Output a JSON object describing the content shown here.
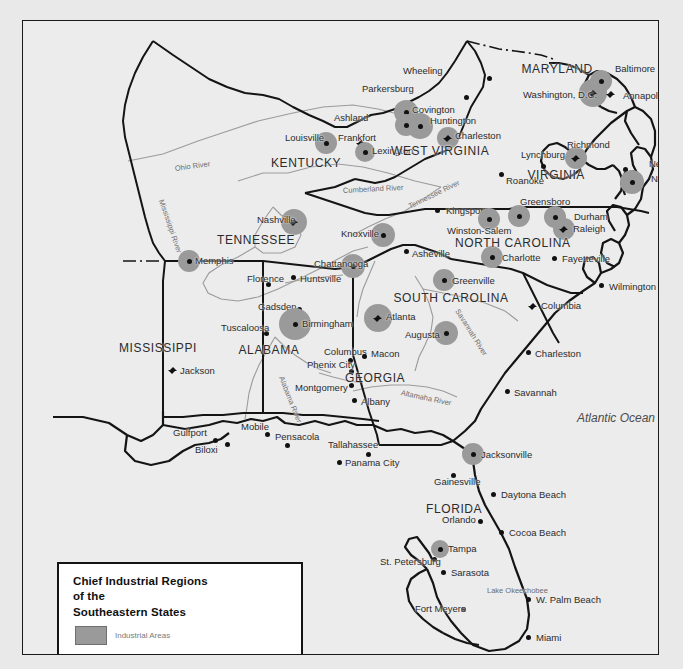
{
  "map": {
    "title_lines": [
      "Chief Industrial Regions",
      "of the",
      "Southeastern States"
    ],
    "legend_swatch_label": "Industrial Areas",
    "ocean_label": "Atlantic Ocean",
    "colors": {
      "background": "#ececec",
      "page": "#e9e9e9",
      "industrial_area": "#9a9a9a",
      "border": "#141414",
      "river": "#9b9b9b",
      "text": "#2b2b2b"
    },
    "states": [
      {
        "name": "MARYLAND",
        "x": 534,
        "y": 48
      },
      {
        "name": "WEST VIRGINIA",
        "x": 417,
        "y": 130
      },
      {
        "name": "KENTUCKY",
        "x": 283,
        "y": 142
      },
      {
        "name": "VIRGINIA",
        "x": 533,
        "y": 154
      },
      {
        "name": "TENNESSEE",
        "x": 233,
        "y": 219
      },
      {
        "name": "NORTH CAROLINA",
        "x": 490,
        "y": 222
      },
      {
        "name": "SOUTH CAROLINA",
        "x": 428,
        "y": 277
      },
      {
        "name": "MISSISSIPPI",
        "x": 135,
        "y": 327
      },
      {
        "name": "ALABAMA",
        "x": 246,
        "y": 329
      },
      {
        "name": "GEORGIA",
        "x": 352,
        "y": 357
      },
      {
        "name": "FLORIDA",
        "x": 431,
        "y": 488
      }
    ],
    "cities": [
      {
        "name": "Wheeling",
        "x": 420,
        "y": 50,
        "anchor": "right",
        "px": 466,
        "py": 57,
        "marker": "dot",
        "industrial": 0
      },
      {
        "name": "Parkersburg",
        "x": 391,
        "y": 68,
        "anchor": "right",
        "px": 443,
        "py": 76,
        "marker": "dot",
        "industrial": 0
      },
      {
        "name": "Covington",
        "x": 389,
        "y": 89,
        "anchor": "left",
        "px": 383,
        "py": 91,
        "marker": "dot",
        "industrial": 12
      },
      {
        "name": "Huntington",
        "x": 407,
        "y": 100,
        "anchor": "left",
        "px": 397,
        "py": 105,
        "marker": "dot",
        "industrial": 13
      },
      {
        "name": "Ashland",
        "x": 345,
        "y": 97,
        "anchor": "right",
        "px": 383,
        "py": 104,
        "marker": "dot",
        "industrial": 11
      },
      {
        "name": "Charleston",
        "x": 432,
        "y": 115,
        "anchor": "left",
        "px": 425,
        "py": 117,
        "marker": "cap",
        "industrial": 11
      },
      {
        "name": "Louisville",
        "x": 262,
        "y": 117,
        "anchor": "left",
        "px": 303,
        "py": 122,
        "marker": "dot",
        "industrial": 11
      },
      {
        "name": "Frankfort",
        "x": 315,
        "y": 117,
        "anchor": "left",
        "px": 338,
        "py": 122,
        "marker": "cap",
        "industrial": 0
      },
      {
        "name": "Lexington",
        "x": 349,
        "y": 130,
        "anchor": "left",
        "px": 342,
        "py": 131,
        "marker": "dot",
        "industrial": 10
      },
      {
        "name": "Lynchburg",
        "x": 498,
        "y": 134,
        "anchor": "left",
        "px": 520,
        "py": 145,
        "marker": "dot",
        "industrial": 0
      },
      {
        "name": "Richmond",
        "x": 544,
        "y": 124,
        "anchor": "left",
        "px": 553,
        "py": 137,
        "marker": "cap",
        "industrial": 11
      },
      {
        "name": "Newport News",
        "x": 626,
        "y": 143,
        "anchor": "left",
        "px": 602,
        "py": 148,
        "marker": "dot",
        "industrial": 0
      },
      {
        "name": "Norfolk",
        "x": 628,
        "y": 158,
        "anchor": "left",
        "px": 609,
        "py": 161,
        "marker": "dot",
        "industrial": 12
      },
      {
        "name": "Roanoke",
        "x": 483,
        "y": 160,
        "anchor": "left",
        "px": 478,
        "py": 153,
        "marker": "dot",
        "industrial": 0
      },
      {
        "name": "Kingsport",
        "x": 423,
        "y": 190,
        "anchor": "left",
        "px": 414,
        "py": 189,
        "marker": "dot",
        "industrial": 0
      },
      {
        "name": "Greensboro",
        "x": 497,
        "y": 181,
        "anchor": "left",
        "px": 496,
        "py": 195,
        "marker": "dot",
        "industrial": 11
      },
      {
        "name": "Durham",
        "x": 551,
        "y": 196,
        "anchor": "left",
        "px": 532,
        "py": 196,
        "marker": "dot",
        "industrial": 11
      },
      {
        "name": "Raleigh",
        "x": 550,
        "y": 208,
        "anchor": "left",
        "px": 541,
        "py": 208,
        "marker": "cap",
        "industrial": 11
      },
      {
        "name": "Winston-Salem",
        "x": 424,
        "y": 210,
        "anchor": "left",
        "px": 466,
        "py": 198,
        "marker": "dot",
        "industrial": 11
      },
      {
        "name": "Nashville",
        "x": 234,
        "y": 199,
        "anchor": "left",
        "px": 271,
        "py": 201,
        "marker": "cap",
        "industrial": 13
      },
      {
        "name": "Knoxville",
        "x": 318,
        "y": 213,
        "anchor": "left",
        "px": 360,
        "py": 214,
        "marker": "dot",
        "industrial": 12
      },
      {
        "name": "Asheville",
        "x": 389,
        "y": 233,
        "anchor": "left",
        "px": 383,
        "py": 230,
        "marker": "dot",
        "industrial": 0
      },
      {
        "name": "Charlotte",
        "x": 479,
        "y": 237,
        "anchor": "left",
        "px": 469,
        "py": 236,
        "marker": "dot",
        "industrial": 11
      },
      {
        "name": "Fayetteville",
        "x": 539,
        "y": 238,
        "anchor": "left",
        "px": 531,
        "py": 237,
        "marker": "dot",
        "industrial": 0
      },
      {
        "name": "Memphis",
        "x": 172,
        "y": 240,
        "anchor": "left",
        "px": 166,
        "py": 240,
        "marker": "dot",
        "industrial": 11
      },
      {
        "name": "Chattanooga",
        "x": 291,
        "y": 243,
        "anchor": "left",
        "px": 330,
        "py": 245,
        "marker": "dot",
        "industrial": 12
      },
      {
        "name": "Greenville",
        "x": 429,
        "y": 260,
        "anchor": "left",
        "px": 421,
        "py": 259,
        "marker": "dot",
        "industrial": 11
      },
      {
        "name": "Wilmington",
        "x": 586,
        "y": 266,
        "anchor": "left",
        "px": 578,
        "py": 264,
        "marker": "dot",
        "industrial": 0
      },
      {
        "name": "Florence",
        "x": 224,
        "y": 258,
        "anchor": "left",
        "px": 245,
        "py": 263,
        "marker": "dot",
        "industrial": 0
      },
      {
        "name": "Huntsville",
        "x": 277,
        "y": 258,
        "anchor": "left",
        "px": 270,
        "py": 256,
        "marker": "dot",
        "industrial": 0
      },
      {
        "name": "Columbia",
        "x": 518,
        "y": 285,
        "anchor": "left",
        "px": 510,
        "py": 285,
        "marker": "cap",
        "industrial": 0
      },
      {
        "name": "Gadsden",
        "x": 235,
        "y": 286,
        "anchor": "left",
        "px": 276,
        "py": 288,
        "marker": "dot",
        "industrial": 0
      },
      {
        "name": "Atlanta",
        "x": 363,
        "y": 296,
        "anchor": "left",
        "px": 355,
        "py": 297,
        "marker": "cap",
        "industrial": 14
      },
      {
        "name": "Augusta",
        "x": 382,
        "y": 314,
        "anchor": "left",
        "px": 423,
        "py": 312,
        "marker": "dot",
        "industrial": 12
      },
      {
        "name": "Birmingham",
        "x": 279,
        "y": 303,
        "anchor": "left",
        "px": 272,
        "py": 303,
        "marker": "dot",
        "industrial": 16
      },
      {
        "name": "Tuscaloosa",
        "x": 198,
        "y": 307,
        "anchor": "left",
        "px": 243,
        "py": 312,
        "marker": "dot",
        "industrial": 0
      },
      {
        "name": "Charleston",
        "x": 512,
        "y": 333,
        "anchor": "left",
        "px": 505,
        "py": 331,
        "marker": "dot",
        "industrial": 0
      },
      {
        "name": "Columbus",
        "x": 301,
        "y": 331,
        "anchor": "left",
        "px": 327,
        "py": 339,
        "marker": "dot",
        "industrial": 0
      },
      {
        "name": "Macon",
        "x": 348,
        "y": 333,
        "anchor": "left",
        "px": 341,
        "py": 335,
        "marker": "dot",
        "industrial": 0
      },
      {
        "name": "Jackson",
        "x": 157,
        "y": 350,
        "anchor": "left",
        "px": 150,
        "py": 349,
        "marker": "cap",
        "industrial": 0
      },
      {
        "name": "Phenix City",
        "x": 284,
        "y": 344,
        "anchor": "left",
        "px": 328,
        "py": 350,
        "marker": "dot",
        "industrial": 0
      },
      {
        "name": "Montgomery",
        "x": 272,
        "y": 367,
        "anchor": "left",
        "px": 328,
        "py": 364,
        "marker": "dot",
        "industrial": 0
      },
      {
        "name": "Savannah",
        "x": 491,
        "y": 372,
        "anchor": "left",
        "px": 484,
        "py": 370,
        "marker": "dot",
        "industrial": 0
      },
      {
        "name": "Albany",
        "x": 338,
        "y": 381,
        "anchor": "left",
        "px": 331,
        "py": 379,
        "marker": "dot",
        "industrial": 0
      },
      {
        "name": "Gulfport",
        "x": 150,
        "y": 412,
        "anchor": "left",
        "px": 192,
        "py": 419,
        "marker": "dot",
        "industrial": 0
      },
      {
        "name": "Mobile",
        "x": 218,
        "y": 406,
        "anchor": "left",
        "px": 244,
        "py": 413,
        "marker": "dot",
        "industrial": 0
      },
      {
        "name": "Pensacola",
        "x": 252,
        "y": 416,
        "anchor": "left",
        "px": 264,
        "py": 424,
        "marker": "dot",
        "industrial": 0
      },
      {
        "name": "Biloxi",
        "x": 172,
        "y": 429,
        "anchor": "left",
        "px": 204,
        "py": 423,
        "marker": "dot",
        "industrial": 0
      },
      {
        "name": "Tallahassee",
        "x": 305,
        "y": 424,
        "anchor": "left",
        "px": 345,
        "py": 433,
        "marker": "dot",
        "industrial": 0
      },
      {
        "name": "Panama City",
        "x": 322,
        "y": 442,
        "anchor": "left",
        "px": 316,
        "py": 441,
        "marker": "dot",
        "industrial": 0
      },
      {
        "name": "Jacksonville",
        "x": 458,
        "y": 434,
        "anchor": "left",
        "px": 450,
        "py": 433,
        "marker": "dot",
        "industrial": 11
      },
      {
        "name": "Gainesville",
        "x": 411,
        "y": 461,
        "anchor": "left",
        "px": 430,
        "py": 454,
        "marker": "dot",
        "industrial": 0
      },
      {
        "name": "Daytona Beach",
        "x": 478,
        "y": 474,
        "anchor": "left",
        "px": 470,
        "py": 473,
        "marker": "dot",
        "industrial": 0
      },
      {
        "name": "Orlando",
        "x": 419,
        "y": 499,
        "anchor": "left",
        "px": 457,
        "py": 500,
        "marker": "dot",
        "industrial": 0
      },
      {
        "name": "Cocoa Beach",
        "x": 486,
        "y": 512,
        "anchor": "left",
        "px": 478,
        "py": 511,
        "marker": "dot",
        "industrial": 0
      },
      {
        "name": "Tampa",
        "x": 425,
        "y": 528,
        "anchor": "left",
        "px": 417,
        "py": 528,
        "marker": "dot",
        "industrial": 9
      },
      {
        "name": "St. Petersburg",
        "x": 357,
        "y": 541,
        "anchor": "left",
        "px": 411,
        "py": 538,
        "marker": "dot",
        "industrial": 0
      },
      {
        "name": "Sarasota",
        "x": 428,
        "y": 552,
        "anchor": "left",
        "px": 420,
        "py": 551,
        "marker": "dot",
        "industrial": 0
      },
      {
        "name": "W. Palm Beach",
        "x": 513,
        "y": 579,
        "anchor": "left",
        "px": 505,
        "py": 578,
        "marker": "dot",
        "industrial": 0
      },
      {
        "name": "Fort Meyers",
        "x": 392,
        "y": 588,
        "anchor": "left",
        "px": 440,
        "py": 588,
        "marker": "dot",
        "industrial": 0
      },
      {
        "name": "Miami",
        "x": 513,
        "y": 617,
        "anchor": "left",
        "px": 505,
        "py": 616,
        "marker": "dot",
        "industrial": 0
      },
      {
        "name": "Washington, D.C.",
        "x": 500,
        "y": 74,
        "anchor": "left",
        "px": 570,
        "py": 72,
        "marker": "cap",
        "industrial": 14
      },
      {
        "name": "Baltimore",
        "x": 592,
        "y": 48,
        "anchor": "left",
        "px": 578,
        "py": 60,
        "marker": "dot",
        "industrial": 11
      },
      {
        "name": "Annapolis",
        "x": 600,
        "y": 75,
        "anchor": "left",
        "px": 588,
        "py": 73,
        "marker": "cap",
        "industrial": 0
      }
    ],
    "rivers": [
      {
        "name": "Ohio River",
        "x": 152,
        "y": 144,
        "rotate": -8
      },
      {
        "name": "Cumberland River",
        "x": 320,
        "y": 166,
        "rotate": -3
      },
      {
        "name": "Tennessee River",
        "x": 386,
        "y": 182,
        "rotate": -26
      },
      {
        "name": "Mississippi River",
        "x": 138,
        "y": 175,
        "rotate": 71
      },
      {
        "name": "Savannah River",
        "x": 434,
        "y": 285,
        "rotate": 58
      },
      {
        "name": "Alabama River",
        "x": 258,
        "y": 352,
        "rotate": 68
      },
      {
        "name": "Altamaha River",
        "x": 378,
        "y": 368,
        "rotate": 12
      }
    ],
    "lakes": [
      {
        "name": "Lake Okeechobee",
        "x": 464,
        "y": 566
      }
    ]
  }
}
